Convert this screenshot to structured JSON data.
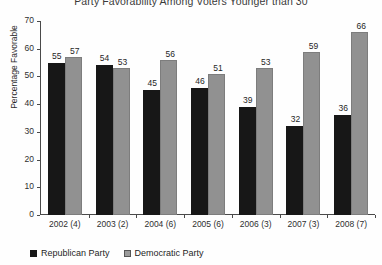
{
  "chart_data": {
    "type": "bar",
    "title": "Party Favorability Among Voters Younger than 30",
    "xlabel": "",
    "ylabel": "Percentage Favorable",
    "ylim": [
      0,
      70
    ],
    "yticks": [
      0,
      10,
      20,
      30,
      40,
      50,
      60,
      70
    ],
    "grid": false,
    "legend_position": "bottom-left",
    "categories": [
      "2002 (4)",
      "2003 (2)",
      "2004 (6)",
      "2005 (6)",
      "2006 (3)",
      "2007 (3)",
      "2008 (7)"
    ],
    "series": [
      {
        "name": "Republican Party",
        "color": "#171717",
        "values": [
          55,
          54,
          45,
          46,
          39,
          32,
          36
        ]
      },
      {
        "name": "Democratic Party",
        "color": "#919191",
        "values": [
          57,
          53,
          56,
          51,
          53,
          59,
          66
        ]
      }
    ]
  }
}
